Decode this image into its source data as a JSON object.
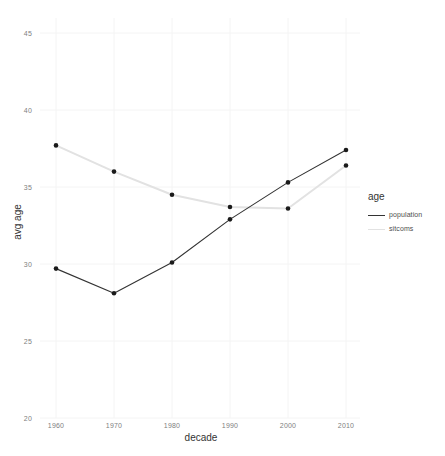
{
  "chart_data": {
    "type": "line",
    "title": "",
    "xlabel": "decade",
    "ylabel": "avg age",
    "x": [
      1960,
      1970,
      1980,
      1990,
      2000,
      2010
    ],
    "xtick_labels": [
      "1960",
      "1970",
      "1980",
      "1990",
      "2000",
      "2010"
    ],
    "ytick_labels": [
      "20",
      "25",
      "30",
      "35",
      "40",
      "45"
    ],
    "ylim": [
      20,
      45
    ],
    "xlim": [
      1955,
      2015
    ],
    "grid": true,
    "legend_position": "right",
    "legend_title": "age",
    "series": [
      {
        "name": "population",
        "color": "#333333",
        "values": [
          29.7,
          28.1,
          30.1,
          32.9,
          35.3,
          37.4
        ]
      },
      {
        "name": "sitcoms",
        "color": "#e2e2e2",
        "values": [
          37.7,
          36.0,
          34.5,
          33.7,
          33.6,
          36.4
        ]
      }
    ]
  },
  "axes": {
    "y_ticks": [
      {
        "label": "45",
        "y": 33
      },
      {
        "label": "40",
        "y": 110
      },
      {
        "label": "35",
        "y": 187
      },
      {
        "label": "30",
        "y": 264
      },
      {
        "label": "25",
        "y": 341
      },
      {
        "label": "20",
        "y": 418
      }
    ],
    "x_ticks": [
      {
        "label": "1960",
        "x": 56
      },
      {
        "label": "1970",
        "x": 114
      },
      {
        "label": "1980",
        "x": 172
      },
      {
        "label": "1990",
        "x": 230
      },
      {
        "label": "2000",
        "x": 288
      },
      {
        "label": "2010",
        "x": 346
      }
    ],
    "x_title": "decade",
    "y_title": "avg age"
  },
  "legend": {
    "title": "age",
    "items": [
      {
        "label": "population",
        "color": "#333333"
      },
      {
        "label": "sitcoms",
        "color": "#e2e2e2"
      }
    ]
  },
  "style": {
    "panel_background": "#ffffff",
    "grid_color": "#f4f4f4",
    "tick_text_color": "#808080",
    "title_text_color": "#333333"
  }
}
